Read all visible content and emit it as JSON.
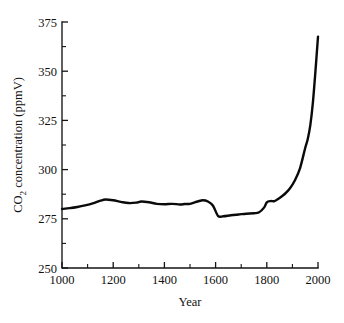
{
  "chart_data": {
    "type": "line",
    "title": "",
    "xlabel": "Year",
    "ylabel": "CO2 concentration (ppmV)",
    "ylabel_display": "CO₂ concentration (ppmV)",
    "xlim": [
      1000,
      2000
    ],
    "ylim": [
      250,
      375
    ],
    "grid": false,
    "legend": "none",
    "x_major_ticks": [
      1000,
      1200,
      1400,
      1600,
      1800,
      2000
    ],
    "x_major_tick_labels": [
      "1000",
      "1200",
      "1400",
      "1600",
      "1800",
      "2000"
    ],
    "x_minor_ticks": [
      1100,
      1300,
      1500,
      1700,
      1900
    ],
    "y_major_ticks": [
      250,
      275,
      300,
      325,
      350,
      375
    ],
    "y_major_tick_labels": [
      "250",
      "275",
      "300",
      "325",
      "350",
      "375"
    ],
    "y_minor_ticks": [
      262.5,
      287.5,
      312.5,
      337.5,
      362.5
    ],
    "series": [
      {
        "name": "CO2 concentration",
        "color": "#0a0a0a",
        "x": [
          1000,
          1030,
          1060,
          1090,
          1120,
          1150,
          1170,
          1200,
          1230,
          1260,
          1290,
          1310,
          1340,
          1370,
          1400,
          1430,
          1460,
          1480,
          1500,
          1530,
          1550,
          1570,
          1590,
          1610,
          1630,
          1660,
          1690,
          1720,
          1750,
          1770,
          1790,
          1800,
          1815,
          1830,
          1850,
          1870,
          1890,
          1910,
          1930,
          1950,
          1960,
          1970,
          1980,
          1990,
          2000
        ],
        "y": [
          280.0,
          280.4,
          281.0,
          281.8,
          282.8,
          284.2,
          284.8,
          284.4,
          283.6,
          283.0,
          283.2,
          283.8,
          283.4,
          282.6,
          282.4,
          282.6,
          282.3,
          282.5,
          282.6,
          283.8,
          284.4,
          283.8,
          281.6,
          276.4,
          276.3,
          276.8,
          277.2,
          277.6,
          277.8,
          278.3,
          280.8,
          283.4,
          284.0,
          284.0,
          285.6,
          287.6,
          290.4,
          294.6,
          300.8,
          311.0,
          315.6,
          322.6,
          334.0,
          350.0,
          367.5
        ]
      }
    ]
  },
  "plot_geometry": {
    "left_px": 62,
    "right_px": 318,
    "top_px": 22,
    "bottom_px": 268
  },
  "axis_labels": {
    "x_axis_title": "Year",
    "y_axis_title_main": "concentration (ppmV)",
    "y_axis_title_prefix": "CO",
    "y_axis_title_sub": "2"
  }
}
